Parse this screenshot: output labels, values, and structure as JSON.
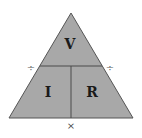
{
  "diagram": {
    "colors": {
      "fill": "#a8a8a8",
      "stroke": "#555555",
      "text": "#1a1a1a",
      "operator": "#555555"
    },
    "sections": {
      "top": {
        "label": "V"
      },
      "bottom_left": {
        "label": "I"
      },
      "bottom_right": {
        "label": "R"
      }
    },
    "operators": {
      "left": "÷",
      "right": "÷",
      "bottom": "×"
    }
  }
}
